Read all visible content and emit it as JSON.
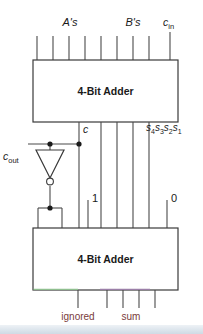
{
  "diagram": {
    "title_semantic": "two-cascaded-4-bit-adders-bcd-style-circuit",
    "blocks": [
      {
        "id": "top-adder",
        "label": "4-Bit Adder"
      },
      {
        "id": "bottom-adder",
        "label": "4-Bit Adder"
      }
    ],
    "labels": {
      "a_inputs": "A's",
      "b_inputs": "B's",
      "carry_in": "c",
      "carry_in_sub": "in",
      "carry_out": "c",
      "carry_out_sub": "out",
      "intermediate_carry": "c",
      "sum_bus": "s",
      "sum_bus_subs": [
        "4",
        "3",
        "2",
        "1"
      ],
      "const_one": "1",
      "const_zero": "0",
      "ignored_output": "ignored",
      "sum_output": "sum"
    },
    "gates": [
      {
        "id": "inverter",
        "type": "not-gate",
        "orientation": "down"
      }
    ],
    "junctions": [
      {
        "id": "carry-tap-left",
        "x": 50,
        "y": 144
      },
      {
        "id": "carry-tap-right",
        "x": 79,
        "y": 144
      },
      {
        "id": "inverter-output-tap",
        "x": 50,
        "y": 208
      }
    ],
    "colors": {
      "wire": "#4a4a4a",
      "box_stroke": "#3a3a3a",
      "box_fill": "#ffffff",
      "text": "#1a1a1a",
      "sum_label": "#7a3b3b",
      "edge_green": "#8fbf8f",
      "edge_purple": "#9b7fa8",
      "footer_band": "#cfdae4"
    }
  }
}
